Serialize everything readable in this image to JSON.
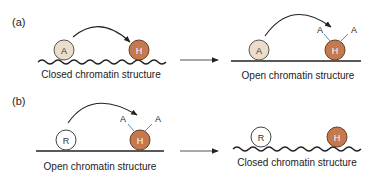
{
  "panels": {
    "a": {
      "label": "(a)",
      "before": {
        "caption": "Closed chromatin structure",
        "left_protein": "A",
        "right_protein": "H"
      },
      "after": {
        "caption": "Open chromatin structure",
        "left_protein": "A",
        "right_protein": "H",
        "modifications": [
          "A",
          "A"
        ]
      }
    },
    "b": {
      "label": "(b)",
      "before": {
        "caption": "Open chromatin structure",
        "left_protein": "R",
        "right_protein": "H",
        "modifications": [
          "A",
          "A"
        ]
      },
      "after": {
        "caption": "Closed chromatin structure",
        "left_protein": "R",
        "right_protein": "H"
      }
    }
  },
  "colors": {
    "activator_fill": "#ecdcca",
    "histone_fill": "#c47a4e",
    "repressor_fill": "#ffffff",
    "stroke": "#3a3a3a"
  }
}
